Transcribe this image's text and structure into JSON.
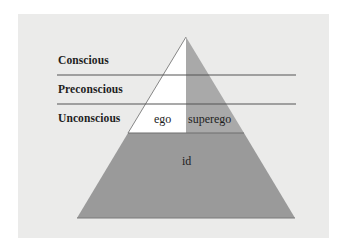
{
  "diagram": {
    "type": "pyramid",
    "levels": [
      {
        "label": "Conscious"
      },
      {
        "label": "Preconscious"
      },
      {
        "label": "Unconscious"
      }
    ],
    "parts": {
      "ego": "ego",
      "superego": "superego",
      "id": "id"
    },
    "colors": {
      "background": "#ebebea",
      "ego": "#ffffff",
      "superego": "#a9a9a9",
      "id": "#9a9a9a",
      "lines": "#555555",
      "text": "#1e1e1e"
    }
  }
}
